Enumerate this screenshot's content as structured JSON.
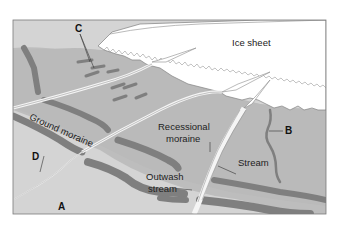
{
  "figure": {
    "colors": {
      "background": "#ffffff",
      "frame": "#7a7a7a",
      "ice": "#ffffff",
      "ice_edge": "#8c8c8c",
      "upper_plain": "#b9b9b9",
      "lower_plain": "#d4d4d4",
      "moraine": "#7f7f7f",
      "stream": "#f2f2f2"
    }
  },
  "labels": {
    "ice_sheet": "Ice sheet",
    "ground_moraine": "Ground moraine",
    "recessional_moraine_1": "Recessional",
    "recessional_moraine_2": "moraine",
    "stream": "Stream",
    "outwash_stream_1": "Outwash",
    "outwash_stream_2": "stream"
  },
  "letters": {
    "a": "A",
    "b": "B",
    "c": "C",
    "d": "D"
  }
}
